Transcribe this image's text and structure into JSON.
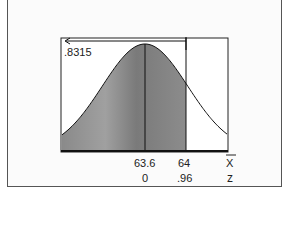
{
  "chart_data": {
    "type": "area",
    "title": "",
    "distribution": "normal",
    "mean": 63.6,
    "shaded_region": "left of 64",
    "shaded_area": 0.8315,
    "area_label": ".8315",
    "x_axis": {
      "label": "x̄",
      "ticks": [
        {
          "value": 63.6,
          "label": "63.6"
        },
        {
          "value": 64,
          "label": "64"
        }
      ]
    },
    "z_axis": {
      "label": "z",
      "ticks": [
        {
          "value": 0,
          "label": "0"
        },
        {
          "value": 0.96,
          "label": ".96"
        }
      ]
    },
    "colors": {
      "shade": "#7a7a7a",
      "line": "#111111"
    }
  },
  "labels": {
    "area": ".8315",
    "xbar_mean": "63.6",
    "xbar_value": "64",
    "xbar_symbol": "X",
    "z_mean": "0",
    "z_value": ".96",
    "z_symbol": "z"
  }
}
